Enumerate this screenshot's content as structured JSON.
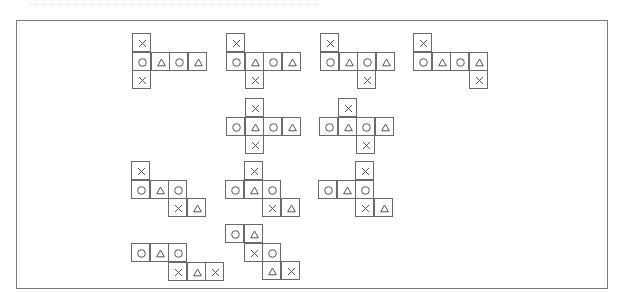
{
  "figure": {
    "cell_size": 18.5,
    "symbols": {
      "X": "cross",
      "O": "circle",
      "T": "triangle"
    },
    "nets": [
      {
        "id": 1,
        "x": 132,
        "y": 33,
        "cells": [
          [
            0,
            0,
            "X"
          ],
          [
            0,
            1,
            "O"
          ],
          [
            1,
            1,
            "T"
          ],
          [
            2,
            1,
            "O"
          ],
          [
            3,
            1,
            "T"
          ],
          [
            0,
            2,
            "X"
          ]
        ]
      },
      {
        "id": 2,
        "x": 226,
        "y": 33,
        "cells": [
          [
            0,
            0,
            "X"
          ],
          [
            0,
            1,
            "O"
          ],
          [
            1,
            1,
            "T"
          ],
          [
            2,
            1,
            "O"
          ],
          [
            3,
            1,
            "T"
          ],
          [
            1,
            2,
            "X"
          ]
        ]
      },
      {
        "id": 3,
        "x": 320,
        "y": 33,
        "cells": [
          [
            0,
            0,
            "X"
          ],
          [
            0,
            1,
            "O"
          ],
          [
            1,
            1,
            "T"
          ],
          [
            2,
            1,
            "O"
          ],
          [
            3,
            1,
            "T"
          ],
          [
            2,
            2,
            "X"
          ]
        ]
      },
      {
        "id": 4,
        "x": 413,
        "y": 33,
        "cells": [
          [
            0,
            0,
            "X"
          ],
          [
            0,
            1,
            "O"
          ],
          [
            1,
            1,
            "T"
          ],
          [
            2,
            1,
            "O"
          ],
          [
            3,
            1,
            "T"
          ],
          [
            3,
            2,
            "X"
          ]
        ]
      },
      {
        "id": 5,
        "x": 226,
        "y": 98,
        "cells": [
          [
            1,
            0,
            "X"
          ],
          [
            0,
            1,
            "O"
          ],
          [
            1,
            1,
            "T"
          ],
          [
            2,
            1,
            "O"
          ],
          [
            3,
            1,
            "T"
          ],
          [
            1,
            2,
            "X"
          ]
        ]
      },
      {
        "id": 6,
        "x": 319,
        "y": 98,
        "cells": [
          [
            1,
            0,
            "X"
          ],
          [
            0,
            1,
            "O"
          ],
          [
            1,
            1,
            "T"
          ],
          [
            2,
            1,
            "O"
          ],
          [
            3,
            1,
            "T"
          ],
          [
            2,
            2,
            "X"
          ]
        ]
      },
      {
        "id": 7,
        "x": 131,
        "y": 161,
        "cells": [
          [
            0,
            0,
            "X"
          ],
          [
            0,
            1,
            "O"
          ],
          [
            1,
            1,
            "T"
          ],
          [
            2,
            1,
            "O"
          ],
          [
            2,
            2,
            "X"
          ],
          [
            3,
            2,
            "T"
          ]
        ]
      },
      {
        "id": 8,
        "x": 225,
        "y": 161,
        "cells": [
          [
            1,
            0,
            "X"
          ],
          [
            0,
            1,
            "O"
          ],
          [
            1,
            1,
            "T"
          ],
          [
            2,
            1,
            "O"
          ],
          [
            2,
            2,
            "X"
          ],
          [
            3,
            2,
            "T"
          ]
        ]
      },
      {
        "id": 9,
        "x": 318,
        "y": 161,
        "cells": [
          [
            2,
            0,
            "X"
          ],
          [
            0,
            1,
            "O"
          ],
          [
            1,
            1,
            "T"
          ],
          [
            2,
            1,
            "O"
          ],
          [
            2,
            2,
            "X"
          ],
          [
            3,
            2,
            "T"
          ]
        ]
      },
      {
        "id": 10,
        "x": 131,
        "y": 243,
        "cells": [
          [
            0,
            0,
            "O"
          ],
          [
            1,
            0,
            "T"
          ],
          [
            2,
            0,
            "O"
          ],
          [
            2,
            1,
            "X"
          ],
          [
            3,
            1,
            "T"
          ],
          [
            4,
            1,
            "X"
          ]
        ]
      },
      {
        "id": 11,
        "x": 225,
        "y": 224,
        "cells": [
          [
            0,
            0,
            "O"
          ],
          [
            1,
            0,
            "T"
          ],
          [
            1,
            1,
            "X"
          ],
          [
            2,
            1,
            "O"
          ],
          [
            2,
            2,
            "T"
          ],
          [
            3,
            2,
            "X"
          ]
        ]
      }
    ]
  }
}
